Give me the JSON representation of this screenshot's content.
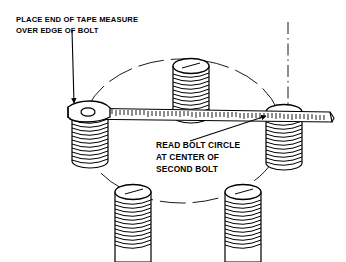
{
  "figure": {
    "background_color": "#ffffff",
    "line_color": "#000000",
    "fill_color": "#ffffff",
    "width": 346,
    "height": 262
  },
  "annotations": {
    "top_left": {
      "name": "place-end-of-tape-note",
      "lines": [
        "PLACE END OF TAPE MEASURE",
        "OVER EDGE OF BOLT"
      ],
      "line1": "PLACE END OF TAPE MEASURE",
      "line2": "OVER EDGE OF BOLT",
      "x": 16,
      "y": 22,
      "leader": {
        "from_x": 72,
        "from_y": 32,
        "to_x": 74,
        "to_y": 104,
        "arrow": "down"
      }
    },
    "center": {
      "name": "read-bolt-circle-note",
      "lines": [
        "READ BOLT CIRCLE",
        "AT CENTER OF",
        "SECOND BOLT"
      ],
      "line1": "READ BOLT CIRCLE",
      "line2": "AT CENTER OF",
      "line3": "SECOND BOLT",
      "x": 156,
      "y": 148,
      "leader": {
        "from_x": 193,
        "from_y": 141,
        "to_x": 264,
        "to_y": 116,
        "arrow": "up-right"
      }
    }
  },
  "bolt_circle": {
    "name": "bolt-circle-ellipse",
    "center_x": 182,
    "center_y": 131,
    "radius_x": 100,
    "radius_y": 72,
    "style": "dashed-thin"
  },
  "centerline": {
    "name": "vertical-centerline",
    "x": 288,
    "y_top": 22,
    "y_bottom": 112,
    "style": "dash-dot"
  },
  "tape_measure": {
    "name": "tape-measure",
    "left_x": 68,
    "right_x": 332,
    "top_y": 108,
    "thickness": 11,
    "tick_count": 58,
    "hook_label": "tape-end-hook",
    "hook_hole": true
  },
  "bolts": [
    {
      "name": "bolt-top",
      "cx": 191,
      "cy": 66,
      "rx": 18,
      "ry": 7,
      "height": 50,
      "threads": 11
    },
    {
      "name": "bolt-left",
      "cx": 90,
      "cy": 113,
      "rx": 18,
      "ry": 7,
      "height": 52,
      "threads": 11
    },
    {
      "name": "bolt-right",
      "cx": 284,
      "cy": 112,
      "rx": 18,
      "ry": 7,
      "height": 55,
      "threads": 11
    },
    {
      "name": "bolt-bottom-left",
      "cx": 133,
      "cy": 192,
      "rx": 18,
      "ry": 7,
      "height": 70,
      "threads": 12
    },
    {
      "name": "bolt-bottom-right",
      "cx": 243,
      "cy": 192,
      "rx": 18,
      "ry": 7,
      "height": 70,
      "threads": 12
    }
  ],
  "bolt_count": 5
}
